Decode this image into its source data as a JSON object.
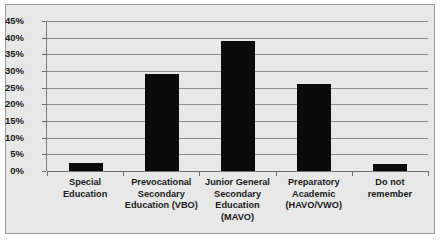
{
  "chart_data": {
    "type": "bar",
    "title": "",
    "subtitle": "",
    "xlabel": "",
    "ylabel": "",
    "categories": [
      "Special Education",
      "Prevocational Secondary Education (VBO)",
      "Junior General Secondary Education (MAVO)",
      "Preparatory Academic (HAVO/VWO)",
      "Do not remember"
    ],
    "category_lines": [
      [
        "Special",
        "Education"
      ],
      [
        "Prevocational",
        "Secondary",
        "Education (VBO)"
      ],
      [
        "Junior General",
        "Secondary",
        "Education",
        "(MAVO)"
      ],
      [
        "Preparatory",
        "Academic",
        "(HAVO/VWO)"
      ],
      [
        "Do not",
        "remember"
      ]
    ],
    "values": [
      2.5,
      29,
      39,
      26,
      2
    ],
    "value_labels": [
      "2.5%",
      "29%",
      "39%",
      "26%",
      "2%"
    ],
    "ylim": [
      0,
      45
    ],
    "ytick_values": [
      0,
      5,
      10,
      15,
      20,
      25,
      30,
      35,
      40,
      45
    ],
    "ytick_labels": [
      "0%",
      "5%",
      "10%",
      "15%",
      "20%",
      "25%",
      "30%",
      "35%",
      "40%",
      "45%"
    ],
    "grid": true,
    "legend": false,
    "legend_position": "none",
    "colors": {
      "bar": "#0a0a0a",
      "plot_background": "#e8e8e8",
      "figure_background": "#e8e8e8",
      "gridline": "#8b8b8b",
      "axis": "#6e6e6e",
      "border": "#9a9a9a",
      "text": "#1a1a1a"
    }
  }
}
